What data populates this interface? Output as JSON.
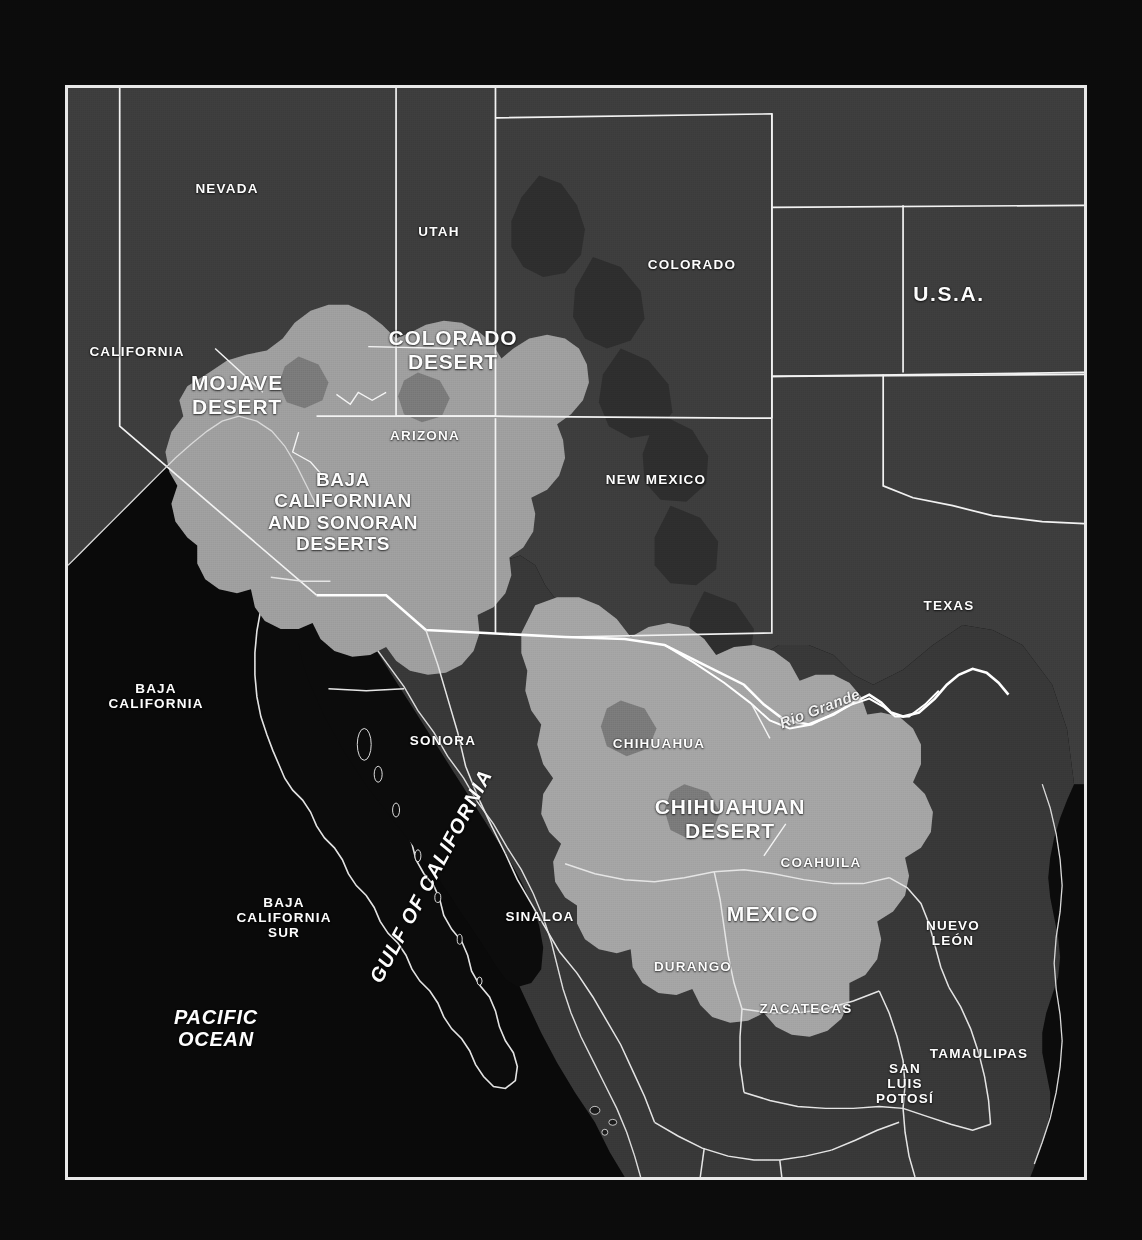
{
  "map": {
    "title": "North American Deserts",
    "frame": {
      "border_color": "#e8e8e8"
    },
    "palette": {
      "ocean": "#0a0a0a",
      "land_base": "#3a3a3a",
      "land_dark": "#303030",
      "desert_light": "#9d9d9d",
      "desert_mid": "#8a8a8a",
      "mountain_dark": "#474747",
      "border_line": "#f0f0f0",
      "label_text": "#fdfdfd"
    },
    "countries": [
      {
        "name": "U.S.A.",
        "x": 946,
        "y": 291
      },
      {
        "name": "MEXICO",
        "x": 770,
        "y": 911
      }
    ],
    "states": [
      {
        "name": "NEVADA",
        "x": 224,
        "y": 186
      },
      {
        "name": "UTAH",
        "x": 436,
        "y": 229
      },
      {
        "name": "COLORADO",
        "x": 689,
        "y": 262
      },
      {
        "name": "CALIFORNIA",
        "x": 134,
        "y": 349
      },
      {
        "name": "ARIZONA",
        "x": 422,
        "y": 433
      },
      {
        "name": "NEW MEXICO",
        "x": 653,
        "y": 477
      },
      {
        "name": "TEXAS",
        "x": 946,
        "y": 603
      },
      {
        "name": "BAJA\nCALIFORNIA",
        "x": 153,
        "y": 693
      },
      {
        "name": "SONORA",
        "x": 440,
        "y": 738
      },
      {
        "name": "CHIHUAHUA",
        "x": 656,
        "y": 741
      },
      {
        "name": "COAHUILA",
        "x": 818,
        "y": 860
      },
      {
        "name": "BAJA\nCALIFORNIA\nSUR",
        "x": 281,
        "y": 915
      },
      {
        "name": "SINALOA",
        "x": 537,
        "y": 914
      },
      {
        "name": "NUEVO\nLEÓN",
        "x": 950,
        "y": 930
      },
      {
        "name": "DURANGO",
        "x": 690,
        "y": 964
      },
      {
        "name": "ZACATECAS",
        "x": 803,
        "y": 1006
      },
      {
        "name": "TAMAULIPAS",
        "x": 976,
        "y": 1051
      },
      {
        "name": "SAN\nLUIS\nPOTOSÍ",
        "x": 902,
        "y": 1081
      }
    ],
    "deserts": [
      {
        "name": "MOJAVE\nDESERT",
        "x": 234,
        "y": 392,
        "size": "desert"
      },
      {
        "name": "COLORADO\nDESERT",
        "x": 450,
        "y": 347,
        "size": "desert"
      },
      {
        "name": "BAJA\nCALIFORNIAN\nAND SONORAN\nDESERTS",
        "x": 340,
        "y": 509,
        "size": "desert-sm"
      },
      {
        "name": "CHIHUAHUAN\nDESERT",
        "x": 727,
        "y": 816,
        "size": "desert"
      }
    ],
    "water": [
      {
        "name": "PACIFIC\nOCEAN",
        "x": 213,
        "y": 1025,
        "kind": "ocean",
        "rotate": 0
      },
      {
        "name": "GULF OF CALIFORNIA",
        "x": 428,
        "y": 873,
        "kind": "gulf",
        "rotate": -62
      }
    ],
    "rivers": [
      {
        "name": "Rio Grande",
        "x": 817,
        "y": 706,
        "rotate": -21
      }
    ],
    "scale": {
      "min_label": "0",
      "max_label": "500 km",
      "unit": "km",
      "max_value": 500,
      "tick_count": 5
    }
  }
}
